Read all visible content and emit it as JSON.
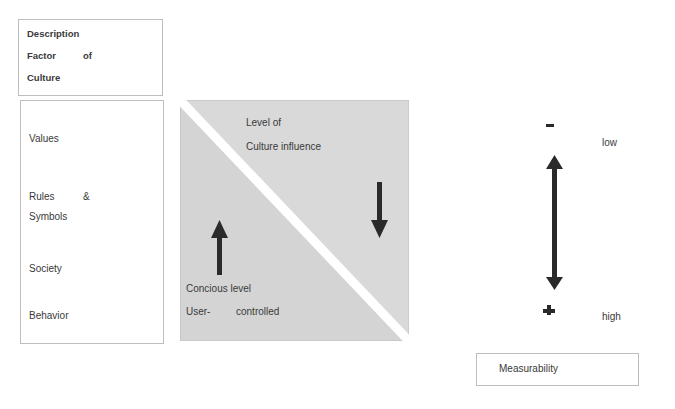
{
  "header_box": {
    "line1": "Description",
    "line2a": "Factor",
    "line2b": "of",
    "line3": "Culture"
  },
  "factors": {
    "values": "Values",
    "rules_a": "Rules",
    "rules_amp": "&",
    "symbols": "Symbols",
    "society": "Society",
    "behavior": "Behavior"
  },
  "triangle": {
    "upper_line1": "Level of",
    "upper_line2": "Culture influence",
    "lower_line1": "Concious level",
    "lower_line2a": "User-",
    "lower_line2b": "controlled"
  },
  "scale": {
    "minus": "-",
    "plus": "+",
    "low": "low",
    "high": "high",
    "label": "Measurability"
  },
  "colors": {
    "fill": "#d6d6d6",
    "stroke": "#bdbdbd",
    "arrow": "#2a2a2a"
  }
}
